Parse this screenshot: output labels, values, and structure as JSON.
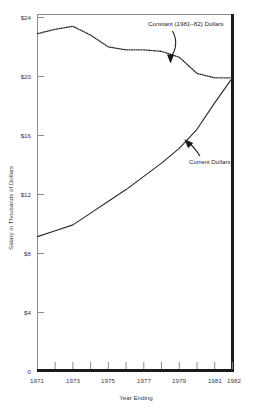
{
  "chart_data": {
    "type": "line",
    "title": "",
    "xlabel": "Year Ending",
    "ylabel": "Salary in Thousands of Dollars",
    "xlim": [
      1971,
      1982
    ],
    "ylim": [
      0,
      24
    ],
    "grid": false,
    "legend_position": "inline-annotations",
    "x": [
      1971,
      1972,
      1973,
      1974,
      1975,
      1976,
      1977,
      1978,
      1979,
      1980,
      1981,
      1982
    ],
    "y_tick_labels": [
      "0",
      "$4",
      "$8",
      "$12",
      "$16",
      "$20",
      "$24"
    ],
    "y_ticks": [
      0,
      4,
      8,
      12,
      16,
      20,
      24
    ],
    "x_tick_labels": [
      "1971",
      "1973",
      "1975",
      "1977",
      "1979",
      "1981",
      "1982"
    ],
    "x_ticks_labeled": [
      1971,
      1973,
      1975,
      1977,
      1979,
      1981,
      1982
    ],
    "x_ticks_all": [
      1971,
      1972,
      1973,
      1974,
      1975,
      1976,
      1977,
      1978,
      1979,
      1980,
      1981,
      1982
    ],
    "series": [
      {
        "name": "Constant (1981-82) Dollars",
        "style": "dotted",
        "values": [
          22.9,
          23.2,
          23.4,
          22.8,
          22.0,
          21.8,
          21.8,
          21.7,
          21.3,
          20.2,
          19.9,
          19.9
        ]
      },
      {
        "name": "Current Dollars",
        "style": "solid",
        "values": [
          9.1,
          9.5,
          9.9,
          10.7,
          11.5,
          12.3,
          13.2,
          14.1,
          15.1,
          16.4,
          18.2,
          19.9
        ]
      }
    ],
    "annotations": [
      {
        "name": "constant-dollars-annotation",
        "text": "Constant (1981–82) Dollars",
        "text_x": 148,
        "text_y": 26,
        "arrow_from_x": 173,
        "arrow_from_y": 31,
        "arrow_to_x": 170,
        "arrow_to_y": 62
      },
      {
        "name": "current-dollars-annotation",
        "text": "Current Dollars",
        "text_x": 189,
        "text_y": 161,
        "arrow_from_x": 200,
        "arrow_from_y": 155,
        "arrow_to_x": 186,
        "arrow_to_y": 138
      }
    ]
  },
  "axes": {
    "y_axis_label": "Salary in Thousands of Dollars",
    "x_axis_label": "Year Ending"
  }
}
